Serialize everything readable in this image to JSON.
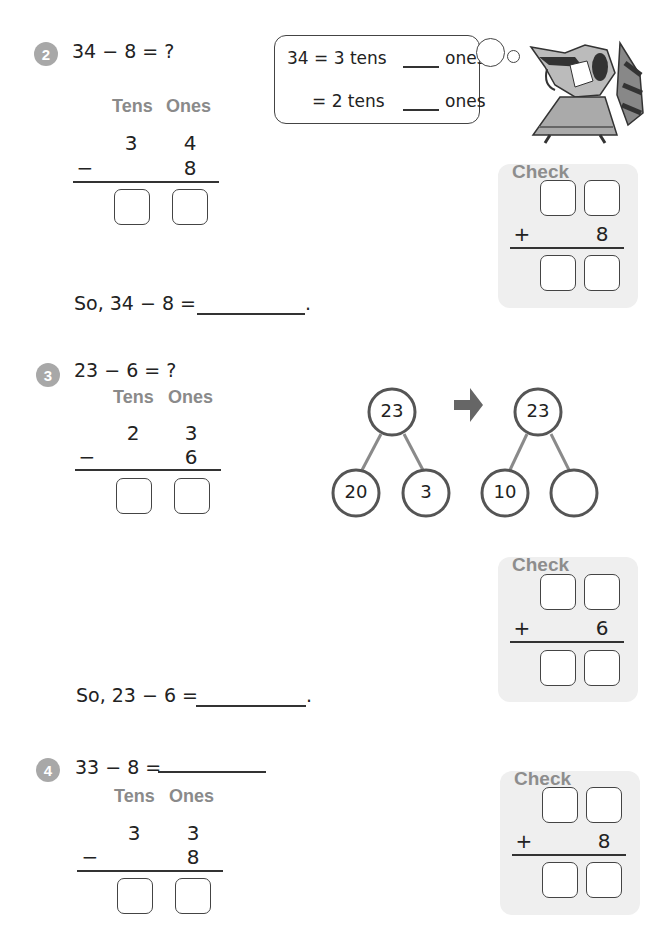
{
  "problems": [
    {
      "number": "2",
      "equation": "34 − 8 = ?",
      "headers": {
        "tens": "Tens",
        "ones": "Ones"
      },
      "top": {
        "tens": "3",
        "ones": "4"
      },
      "bottom": {
        "op": "−",
        "ones": "8"
      },
      "conclusion": "So, 34 − 8 =",
      "conclusion_end": ".",
      "thought": {
        "line1_prefix": "34 = 3 tens",
        "line1_suffix": "ones",
        "line2_prefix": "= 2 tens",
        "line2_suffix": "ones"
      },
      "check": {
        "title": "Check",
        "op": "+",
        "addend": "8"
      }
    },
    {
      "number": "3",
      "equation": "23 − 6 = ?",
      "headers": {
        "tens": "Tens",
        "ones": "Ones"
      },
      "top": {
        "tens": "2",
        "ones": "3"
      },
      "bottom": {
        "op": "−",
        "ones": "6"
      },
      "number_bonds": [
        {
          "whole": "23",
          "part1": "20",
          "part2": "3"
        },
        {
          "whole": "23",
          "part1": "10",
          "part2": ""
        }
      ],
      "arrow": "right-arrow-icon",
      "conclusion": "So, 23 − 6 =",
      "conclusion_end": ".",
      "check": {
        "title": "Check",
        "op": "+",
        "addend": "6"
      }
    },
    {
      "number": "4",
      "equation": "33 − 8 =",
      "headers": {
        "tens": "Tens",
        "ones": "Ones"
      },
      "top": {
        "tens": "3",
        "ones": "3"
      },
      "bottom": {
        "op": "−",
        "ones": "8"
      },
      "check": {
        "title": "Check",
        "op": "+",
        "addend": "8"
      }
    }
  ],
  "colors": {
    "badge": "#a8a8a8",
    "header_text": "#8a8a8a",
    "check_bg": "#efefef",
    "bond_circle": "#555555",
    "bond_line": "#8a8a8a",
    "arrow": "#666666"
  }
}
